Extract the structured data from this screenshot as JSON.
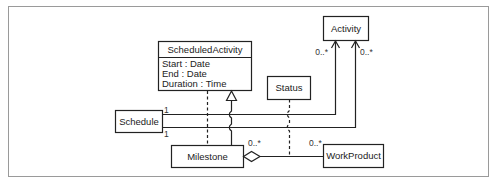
{
  "diagram": {
    "type": "UML class diagram",
    "classes": {
      "scheduled_activity": {
        "name": "ScheduledActivity",
        "attributes": [
          "Start : Date",
          "End : Date",
          "Duration : Time"
        ]
      },
      "activity": {
        "name": "Activity"
      },
      "status": {
        "name": "Status"
      },
      "schedule": {
        "name": "Schedule"
      },
      "milestone": {
        "name": "Milestone"
      },
      "work_product": {
        "name": "WorkProduct"
      }
    },
    "multiplicities": {
      "activity_left": "0..*",
      "activity_right": "0..*",
      "schedule_upper": "1",
      "schedule_lower": "1",
      "milestone_aggregation": "0..*",
      "work_product": "0..*"
    },
    "colors": {
      "line": "#222222",
      "frame": "#9a9a9a",
      "background": "#ffffff"
    }
  }
}
